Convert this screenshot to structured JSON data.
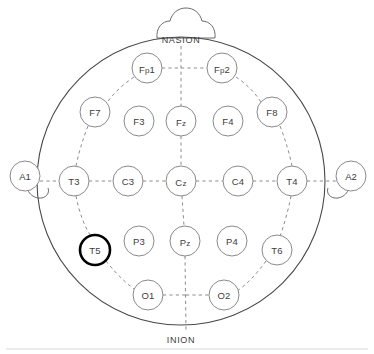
{
  "diagram": {
    "view": "top-down head map",
    "canvas": {
      "width": 374,
      "height": 354
    },
    "colors": {
      "head_outline": "#4a4a4a",
      "electrode_stroke": "#8a8a8a",
      "highlight_stroke": "#000000",
      "guide_dash": "#8d8d8d",
      "label_text": "#3d3d3d",
      "background": "#ffffff"
    },
    "head": {
      "cx": 181,
      "cy": 181,
      "r": 144
    },
    "anatomical_labels": [
      {
        "name": "nasion-label",
        "text": "NASION",
        "x": 181,
        "y": 40
      },
      {
        "name": "inion-label",
        "text": "INION",
        "x": 181,
        "y": 340
      }
    ],
    "reference_electrodes": [
      {
        "name": "A1",
        "label": "A1",
        "side": "left",
        "cx": 25,
        "cy": 176,
        "r": 15
      },
      {
        "name": "A2",
        "label": "A2",
        "side": "right",
        "cx": 351,
        "cy": 176,
        "r": 15
      }
    ],
    "electrodes": [
      {
        "name": "Fp1",
        "label": "Fp1",
        "base": "F",
        "sub": "p",
        "rest": "1",
        "cx": 147,
        "cy": 68,
        "r": 15,
        "highlight": false,
        "region": "prefrontal-left"
      },
      {
        "name": "Fp2",
        "label": "Fp2",
        "base": "F",
        "sub": "p",
        "rest": "2",
        "cx": 222,
        "cy": 68,
        "r": 15,
        "highlight": false,
        "region": "prefrontal-right"
      },
      {
        "name": "F7",
        "label": "F7",
        "base": "F7",
        "sub": "",
        "rest": "",
        "cx": 95,
        "cy": 112,
        "r": 15,
        "highlight": false,
        "region": "frontal-left-lateral"
      },
      {
        "name": "F3",
        "label": "F3",
        "base": "F3",
        "sub": "",
        "rest": "",
        "cx": 139,
        "cy": 121,
        "r": 15,
        "highlight": false,
        "region": "frontal-left"
      },
      {
        "name": "Fz",
        "label": "Fz",
        "base": "F",
        "sub": "z",
        "rest": "",
        "cx": 181,
        "cy": 121,
        "r": 15,
        "highlight": false,
        "region": "frontal-midline"
      },
      {
        "name": "F4",
        "label": "F4",
        "base": "F4",
        "sub": "",
        "rest": "",
        "cx": 228,
        "cy": 121,
        "r": 15,
        "highlight": false,
        "region": "frontal-right"
      },
      {
        "name": "F8",
        "label": "F8",
        "base": "F8",
        "sub": "",
        "rest": "",
        "cx": 272,
        "cy": 112,
        "r": 15,
        "highlight": false,
        "region": "frontal-right-lateral"
      },
      {
        "name": "T3",
        "label": "T3",
        "base": "T3",
        "sub": "",
        "rest": "",
        "cx": 74,
        "cy": 181,
        "r": 15,
        "highlight": false,
        "region": "temporal-left"
      },
      {
        "name": "C3",
        "label": "C3",
        "base": "C3",
        "sub": "",
        "rest": "",
        "cx": 128,
        "cy": 181,
        "r": 15,
        "highlight": false,
        "region": "central-left"
      },
      {
        "name": "Cz",
        "label": "Cz",
        "base": "C",
        "sub": "z",
        "rest": "",
        "cx": 181,
        "cy": 181,
        "r": 15,
        "highlight": false,
        "region": "central-midline"
      },
      {
        "name": "C4",
        "label": "C4",
        "base": "C4",
        "sub": "",
        "rest": "",
        "cx": 238,
        "cy": 181,
        "r": 15,
        "highlight": false,
        "region": "central-right"
      },
      {
        "name": "T4",
        "label": "T4",
        "base": "T4",
        "sub": "",
        "rest": "",
        "cx": 292,
        "cy": 181,
        "r": 15,
        "highlight": false,
        "region": "temporal-right"
      },
      {
        "name": "T5",
        "label": "T5",
        "base": "T5",
        "sub": "",
        "rest": "",
        "cx": 95,
        "cy": 250,
        "r": 15,
        "highlight": true,
        "region": "temporal-posterior-left"
      },
      {
        "name": "P3",
        "label": "P3",
        "base": "P3",
        "sub": "",
        "rest": "",
        "cx": 139,
        "cy": 241,
        "r": 15,
        "highlight": false,
        "region": "parietal-left"
      },
      {
        "name": "Pz",
        "label": "Pz",
        "base": "P",
        "sub": "z",
        "rest": "",
        "cx": 185,
        "cy": 241,
        "r": 15,
        "highlight": false,
        "region": "parietal-midline"
      },
      {
        "name": "P4",
        "label": "P4",
        "base": "P4",
        "sub": "",
        "rest": "",
        "cx": 232,
        "cy": 241,
        "r": 15,
        "highlight": false,
        "region": "parietal-right"
      },
      {
        "name": "T6",
        "label": "T6",
        "base": "T6",
        "sub": "",
        "rest": "",
        "cx": 277,
        "cy": 250,
        "r": 15,
        "highlight": false,
        "region": "temporal-posterior-right"
      },
      {
        "name": "O1",
        "label": "O1",
        "base": "O1",
        "sub": "",
        "rest": "",
        "cx": 148,
        "cy": 295,
        "r": 15,
        "highlight": false,
        "region": "occipital-left"
      },
      {
        "name": "O2",
        "label": "O2",
        "base": "O2",
        "sub": "",
        "rest": "",
        "cx": 224,
        "cy": 295,
        "r": 15,
        "highlight": false,
        "region": "occipital-right"
      }
    ],
    "highlighted_electrode": "T5",
    "legend": {
      "note": "",
      "count_label": ""
    }
  },
  "chart_data": {
    "type": "scatter",
    "xlabel": "",
    "ylabel": "",
    "categories": [
      "Fp1",
      "Fp2",
      "F7",
      "F3",
      "Fz",
      "F4",
      "F8",
      "T3",
      "C3",
      "Cz",
      "C4",
      "T4",
      "T5",
      "P3",
      "Pz",
      "P4",
      "T6",
      "O1",
      "O2",
      "A1",
      "A2"
    ],
    "values": [
      1,
      1,
      1,
      1,
      1,
      1,
      1,
      1,
      1,
      1,
      1,
      1,
      1,
      1,
      1,
      1,
      1,
      1,
      1,
      1,
      1
    ]
  }
}
